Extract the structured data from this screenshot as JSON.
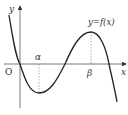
{
  "diagram": {
    "type": "function-graph",
    "labels": {
      "y_axis": "y",
      "x_axis": "x",
      "origin": "O",
      "alpha": "α",
      "beta": "β",
      "curve": "y=f(x)"
    },
    "features": {
      "local_minimum_at": "α",
      "local_maximum_at": "β",
      "passes_through_origin": true
    }
  }
}
